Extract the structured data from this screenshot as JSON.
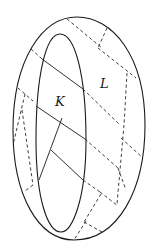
{
  "figure": {
    "type": "torus-like surface with inner and outer boundary curves",
    "labels": {
      "inner_region": "K",
      "outer_region": "L"
    },
    "colors": {
      "stroke": "#1a1a1a",
      "background": "#ffffff"
    }
  }
}
